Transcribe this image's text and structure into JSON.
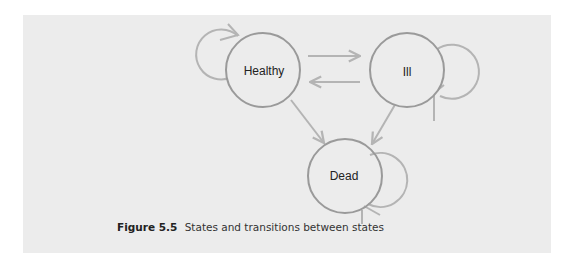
{
  "diagram": {
    "type": "state-transition",
    "colors": {
      "panel_background": "#ececec",
      "node_stroke": "#9a9a9a",
      "arrow_stroke": "#b4b4b4",
      "label_text": "#222222"
    },
    "nodes": [
      {
        "id": "healthy",
        "label": "Healthy",
        "cx": 263,
        "cy": 70,
        "r": 37
      },
      {
        "id": "ill",
        "label": "Ill",
        "cx": 407,
        "cy": 70,
        "r": 37
      },
      {
        "id": "dead",
        "label": "Dead",
        "cx": 345,
        "cy": 176,
        "r": 37
      }
    ],
    "edges": [
      {
        "from": "healthy",
        "to": "healthy",
        "kind": "self-loop"
      },
      {
        "from": "healthy",
        "to": "ill"
      },
      {
        "from": "ill",
        "to": "healthy"
      },
      {
        "from": "ill",
        "to": "ill",
        "kind": "self-loop"
      },
      {
        "from": "healthy",
        "to": "dead"
      },
      {
        "from": "ill",
        "to": "dead"
      },
      {
        "from": "dead",
        "to": "dead",
        "kind": "self-loop"
      }
    ]
  },
  "caption": {
    "figure_number": "Figure 5.5",
    "text": "States and transitions between states"
  }
}
